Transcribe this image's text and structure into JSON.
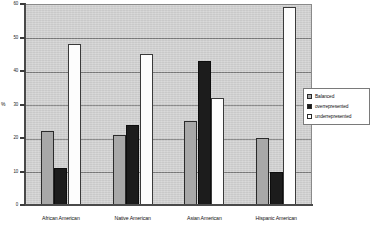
{
  "chart_data": {
    "type": "bar",
    "title": "",
    "subtitle": "",
    "xlabel": "",
    "ylabel": "%",
    "ylim": [
      0,
      60
    ],
    "ytick_step": 10,
    "yticks": [
      "0",
      "10",
      "20",
      "30",
      "40",
      "50",
      "60"
    ],
    "grid": true,
    "legend_position": "right",
    "categories": [
      "African American",
      "Native American",
      "Asian American",
      "Hispanic American"
    ],
    "series": [
      {
        "name": "Balanced",
        "color": "#a8a8a8",
        "values": [
          22,
          21,
          25,
          20
        ]
      },
      {
        "name": "overrepresented",
        "color": "#1c1c1c",
        "values": [
          11,
          24,
          43,
          10
        ]
      },
      {
        "name": "underrepresented",
        "color": "#fdfdfd",
        "values": [
          48,
          45,
          32,
          59
        ]
      }
    ],
    "colors": {
      "plot_background": "#d2d2d2",
      "gridline": "#6f6f6f",
      "axis": "#4a4a4a",
      "legend_background": "#ffffff",
      "text": "#111111"
    }
  }
}
